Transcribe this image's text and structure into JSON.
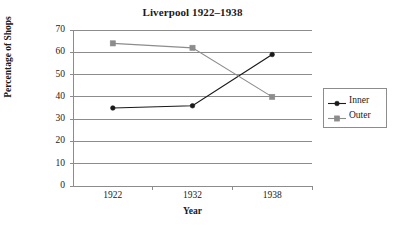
{
  "chart_data": {
    "type": "line",
    "title": "Liverpool 1922–1938",
    "xlabel": "Year",
    "ylabel": "Percentage of Shops",
    "categories": [
      "1922",
      "1932",
      "1938"
    ],
    "series": [
      {
        "name": "Inner",
        "values": [
          35,
          36,
          59
        ],
        "color": "#1a1a1a",
        "marker": "circle"
      },
      {
        "name": "Outer",
        "values": [
          64,
          62,
          40
        ],
        "color": "#8c8c8c",
        "marker": "square"
      }
    ],
    "ylim": [
      0,
      70
    ],
    "y_ticks": [
      "0",
      "10",
      "20",
      "30",
      "40",
      "50",
      "60",
      "70"
    ],
    "grid": "horizontal",
    "legend_position": "right",
    "axis_color": "#8c8c8c",
    "background": "#ffffff"
  }
}
